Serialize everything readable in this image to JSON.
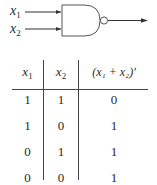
{
  "diagram": {
    "gate_type": "NOR",
    "inputs": [
      {
        "var": "x",
        "sub": "1"
      },
      {
        "var": "x",
        "sub": "2"
      }
    ],
    "output_label": ""
  },
  "truth_table": {
    "headers": [
      {
        "var": "x",
        "sub": "1"
      },
      {
        "var": "x",
        "sub": "2"
      },
      {
        "text": "(x₁ + x₂)′"
      }
    ],
    "rows": [
      [
        "1",
        "1",
        "0"
      ],
      [
        "1",
        "0",
        "1"
      ],
      [
        "0",
        "1",
        "1"
      ],
      [
        "0",
        "0",
        "1"
      ]
    ]
  }
}
